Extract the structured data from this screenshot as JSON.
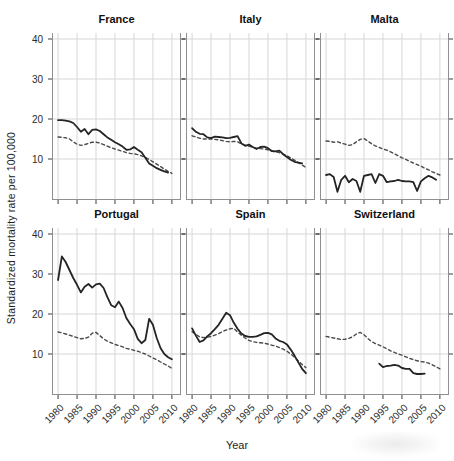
{
  "figure": {
    "xlabel": "Year",
    "ylabel": "Standardized mortality rate per 100,000"
  },
  "chart_data": {
    "type": "line",
    "title": "",
    "xlabel": "Year",
    "ylabel": "Standardized mortality rate per 100,000",
    "x_ticks": [
      1980,
      1985,
      1990,
      1995,
      2000,
      2005,
      2010
    ],
    "y_ticks": [
      40,
      30,
      20,
      10
    ],
    "xlim": [
      1978.4,
      2012.4
    ],
    "ylim": [
      -0.25,
      41.5
    ],
    "grid": true,
    "legend": "none",
    "line_styles": {
      "solid_color": "#242424",
      "dashed_color": "#4a4a4a"
    },
    "facets": [
      {
        "title": "France",
        "row": 0,
        "col": 0,
        "series": [
          {
            "style": "solid",
            "year_start": 1980,
            "values": [
              19.7,
              19.7,
              19.6,
              19.4,
              19.0,
              18.0,
              16.8,
              17.5,
              16.2,
              17.3,
              17.4,
              17.0,
              16.2,
              15.4,
              14.8,
              14.2,
              13.7,
              13.1,
              12.3,
              12.4,
              13.0,
              12.3,
              11.7,
              10.3,
              8.9,
              8.3,
              7.7,
              7.3,
              6.9,
              6.6
            ]
          },
          {
            "style": "dashed",
            "year_start": 1980,
            "values": [
              15.5,
              15.4,
              15.3,
              15.0,
              14.3,
              13.7,
              13.4,
              13.6,
              13.9,
              14.2,
              14.2,
              14.0,
              13.6,
              13.2,
              12.8,
              12.5,
              12.2,
              11.9,
              11.6,
              11.4,
              11.3,
              11.1,
              10.8,
              10.4,
              9.9,
              9.3,
              8.7,
              8.1,
              7.5,
              6.9,
              6.4
            ]
          }
        ]
      },
      {
        "title": "Italy",
        "row": 0,
        "col": 1,
        "series": [
          {
            "style": "solid",
            "year_start": 1980,
            "values": [
              17.7,
              16.8,
              16.3,
              16.2,
              15.4,
              15.2,
              15.6,
              15.5,
              15.4,
              15.2,
              15.3,
              15.5,
              15.7,
              13.9,
              13.3,
              13.6,
              13.0,
              12.5,
              13.0,
              13.1,
              12.7,
              12.0,
              11.9,
              12.1,
              11.2,
              10.5,
              9.8,
              9.3,
              9.1,
              8.9
            ]
          },
          {
            "style": "dashed",
            "year_start": 1980,
            "values": [
              15.8,
              15.5,
              15.2,
              15.0,
              15.0,
              15.0,
              14.9,
              14.8,
              14.6,
              14.4,
              14.3,
              14.4,
              14.3,
              13.8,
              13.4,
              13.2,
              12.9,
              12.7,
              12.6,
              12.5,
              12.3,
              12.0,
              11.8,
              11.6,
              11.2,
              10.8,
              10.3,
              9.7,
              9.1,
              8.5,
              7.9
            ]
          }
        ]
      },
      {
        "title": "Malta",
        "row": 0,
        "col": 2,
        "series": [
          {
            "style": "solid",
            "year_start": 1980,
            "values": [
              6.0,
              6.2,
              5.5,
              1.8,
              4.8,
              5.8,
              4.2,
              5.0,
              4.5,
              1.8,
              5.8,
              6.0,
              6.2,
              4.0,
              6.2,
              5.8,
              4.2,
              4.4,
              4.5,
              4.8,
              4.5,
              4.4,
              4.4,
              4.2,
              2.0,
              4.4,
              5.2,
              5.8,
              5.4,
              4.8
            ]
          },
          {
            "style": "dashed",
            "year_start": 1980,
            "values": [
              14.5,
              14.4,
              14.2,
              14.3,
              14.0,
              13.7,
              13.4,
              13.6,
              14.3,
              14.9,
              15.1,
              14.5,
              13.8,
              13.3,
              12.9,
              12.5,
              12.2,
              11.8,
              11.3,
              10.8,
              10.3,
              9.9,
              9.4,
              9.0,
              8.6,
              8.2,
              7.7,
              7.3,
              6.8,
              6.4,
              6.0
            ]
          }
        ]
      },
      {
        "title": "Portugal",
        "row": 1,
        "col": 0,
        "series": [
          {
            "style": "solid",
            "year_start": 1980,
            "values": [
              28.5,
              34.4,
              33.0,
              31.0,
              29.0,
              27.3,
              25.4,
              26.8,
              27.5,
              26.6,
              27.4,
              27.6,
              26.5,
              24.2,
              22.2,
              21.7,
              23.1,
              21.5,
              19.0,
              17.5,
              16.2,
              13.8,
              12.7,
              13.5,
              18.8,
              17.3,
              14.0,
              11.5,
              10.0,
              9.2,
              8.7
            ]
          },
          {
            "style": "dashed",
            "year_start": 1980,
            "values": [
              15.5,
              15.3,
              15.0,
              14.7,
              14.4,
              14.1,
              13.8,
              13.9,
              14.2,
              15.2,
              15.4,
              14.6,
              13.8,
              13.2,
              12.8,
              12.4,
              12.1,
              11.8,
              11.4,
              11.2,
              10.9,
              10.7,
              10.3,
              10.0,
              9.5,
              9.0,
              8.6,
              8.0,
              7.5,
              7.0,
              6.4
            ]
          }
        ]
      },
      {
        "title": "Spain",
        "row": 1,
        "col": 1,
        "series": [
          {
            "style": "solid",
            "year_start": 1980,
            "values": [
              16.4,
              14.6,
              13.0,
              13.4,
              14.4,
              15.2,
              16.2,
              17.3,
              18.8,
              20.3,
              19.7,
              17.8,
              16.3,
              15.1,
              14.5,
              14.3,
              14.3,
              14.4,
              14.8,
              15.2,
              15.3,
              14.9,
              13.9,
              13.3,
              13.0,
              12.4,
              11.1,
              9.6,
              7.9,
              6.3,
              5.2
            ]
          },
          {
            "style": "dashed",
            "year_start": 1980,
            "values": [
              15.6,
              14.9,
              14.3,
              14.1,
              14.2,
              14.4,
              14.7,
              15.1,
              15.6,
              16.0,
              16.3,
              16.4,
              15.5,
              14.7,
              14.0,
              13.4,
              13.1,
              12.9,
              12.8,
              12.7,
              12.5,
              12.2,
              12.0,
              11.6,
              11.2,
              10.7,
              10.0,
              9.2,
              8.3,
              7.4,
              6.6
            ]
          }
        ]
      },
      {
        "title": "Switzerland",
        "row": 1,
        "col": 2,
        "series": [
          {
            "style": "solid",
            "year_start": 1994,
            "values": [
              7.6,
              6.7,
              7.0,
              7.1,
              7.3,
              7.1,
              6.5,
              6.3,
              6.3,
              5.2,
              5.0,
              5.0,
              5.1
            ]
          },
          {
            "style": "dashed",
            "year_start": 1980,
            "values": [
              14.4,
              14.2,
              14.0,
              13.8,
              13.6,
              13.7,
              13.9,
              14.3,
              15.0,
              15.4,
              14.8,
              13.9,
              13.1,
              12.6,
              12.2,
              11.8,
              11.3,
              10.8,
              10.4,
              10.0,
              9.7,
              9.3,
              8.9,
              8.6,
              8.3,
              8.1,
              8.0,
              7.7,
              7.3,
              6.8,
              6.3
            ]
          }
        ]
      }
    ]
  }
}
